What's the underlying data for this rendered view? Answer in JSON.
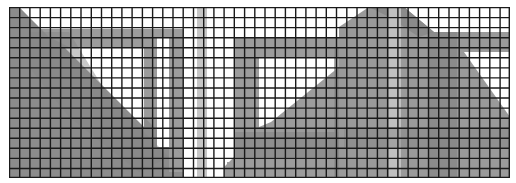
{
  "image": {
    "description": "Grayscale image of triangular truss/bracket structures overlaid with a black square grid",
    "grid": {
      "columns": 49,
      "rows": 17,
      "line_color": "#1a1a1a",
      "cell_w": 10.22,
      "cell_h": 10.06
    },
    "colors": {
      "background": "#ffffff",
      "shape_gray": "#9a9a9a",
      "shape_dark": "#7e7e7e",
      "pillar_light": "#c4c4c4"
    }
  }
}
